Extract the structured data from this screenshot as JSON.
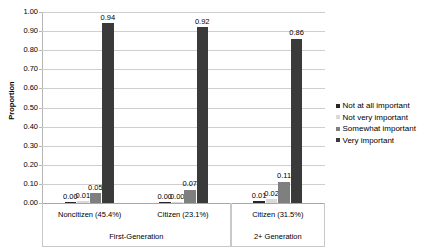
{
  "chart_data": {
    "type": "bar",
    "title": "",
    "xlabel": "",
    "ylabel": "Proportion",
    "ylim": [
      0,
      1.0
    ],
    "ytick_step": 0.1,
    "ytick_labels": [
      "0.00",
      "0.10",
      "0.20",
      "0.30",
      "0.40",
      "0.50",
      "0.60",
      "0.70",
      "0.80",
      "0.90",
      "1.00"
    ],
    "grid": true,
    "legend_position": "right",
    "categories": [
      "Noncitizen (45.4%)",
      "Citizen (23.1%)",
      "Citizen (31.5%)"
    ],
    "group_labels": [
      {
        "label": "First-Generation",
        "span": 2
      },
      {
        "label": "2+ Generation",
        "span": 1
      }
    ],
    "series": [
      {
        "name": "Not at all important",
        "color": "#262626",
        "values": [
          0.0,
          0.0,
          0.01
        ],
        "labels": [
          "0.00",
          "0.00",
          "0.01"
        ]
      },
      {
        "name": "Not very important",
        "color": "#d9d9d9",
        "values": [
          0.01,
          0.0,
          0.02
        ],
        "labels": [
          "0.01",
          "0.00",
          "0.02"
        ]
      },
      {
        "name": "Somewhat important",
        "color": "#7f7f7f",
        "values": [
          0.05,
          0.07,
          0.11
        ],
        "labels": [
          "0.05",
          "0.07",
          "0.11"
        ]
      },
      {
        "name": "Very important",
        "color": "#3a3a3a",
        "values": [
          0.94,
          0.92,
          0.86
        ],
        "labels": [
          "0.94",
          "0.92",
          "0.86"
        ]
      }
    ]
  },
  "legend": {
    "items": [
      {
        "label": "Not at all important",
        "color": "#262626"
      },
      {
        "label": "Not very important",
        "color": "#d9d9d9"
      },
      {
        "label": "Somewhat important",
        "color": "#7f7f7f"
      },
      {
        "label": "Very important",
        "color": "#3a3a3a"
      }
    ]
  }
}
